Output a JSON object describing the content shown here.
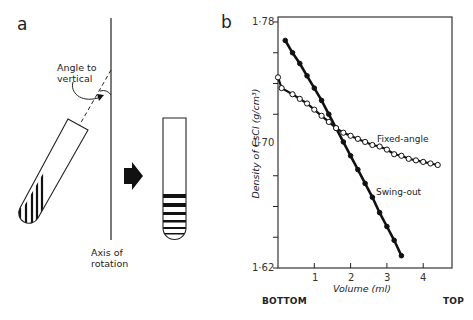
{
  "panel_a": {
    "label": "a",
    "angle_label_line1": "Angle to",
    "angle_label_line2": "vertical",
    "axis_label_line1": "Axis of",
    "axis_label_line2": "rotation"
  },
  "panel_b": {
    "label": "b",
    "bottom_label": "BOTTOM",
    "top_label": "TOP"
  },
  "chart_data": {
    "type": "line",
    "title": "",
    "xlabel": "Volume (ml)",
    "ylabel": "Density of CsCl (g/cm³)",
    "xlim": [
      0,
      4.8
    ],
    "ylim": [
      1.62,
      1.78
    ],
    "x_ticks": [
      "1",
      "2",
      "3",
      "4"
    ],
    "y_tick_labels": [
      "1·78",
      "1·70",
      "1·62"
    ],
    "y_minor_ticks": [
      1.76,
      1.74,
      1.72,
      1.68,
      1.66,
      1.64
    ],
    "grid": false,
    "legend": "inline labels",
    "annotations": [
      "Fixed-angle",
      "Swing-out",
      "BOTTOM",
      "TOP"
    ],
    "series": [
      {
        "name": "Swing-out",
        "marker": "filled-circle",
        "x": [
          0.2,
          0.4,
          0.6,
          0.8,
          1.0,
          1.2,
          1.4,
          1.6,
          1.8,
          2.0,
          2.2,
          2.4,
          2.6,
          2.8,
          3.0,
          3.2,
          3.4
        ],
        "y": [
          1.768,
          1.76,
          1.753,
          1.745,
          1.737,
          1.729,
          1.72,
          1.711,
          1.702,
          1.693,
          1.684,
          1.675,
          1.666,
          1.656,
          1.647,
          1.638,
          1.628
        ]
      },
      {
        "name": "Fixed-angle",
        "marker": "open-circle",
        "x": [
          0.0,
          0.1,
          0.4,
          0.6,
          0.8,
          1.0,
          1.2,
          1.4,
          1.6,
          1.8,
          2.0,
          2.2,
          2.4,
          2.6,
          2.8,
          3.0,
          3.2,
          3.4,
          3.6,
          3.8,
          4.0,
          4.2,
          4.4
        ],
        "y": [
          1.744,
          1.737,
          1.733,
          1.73,
          1.727,
          1.723,
          1.719,
          1.715,
          1.711,
          1.708,
          1.706,
          1.704,
          1.702,
          1.7,
          1.699,
          1.697,
          1.694,
          1.693,
          1.691,
          1.69,
          1.689,
          1.688,
          1.687
        ]
      }
    ]
  }
}
